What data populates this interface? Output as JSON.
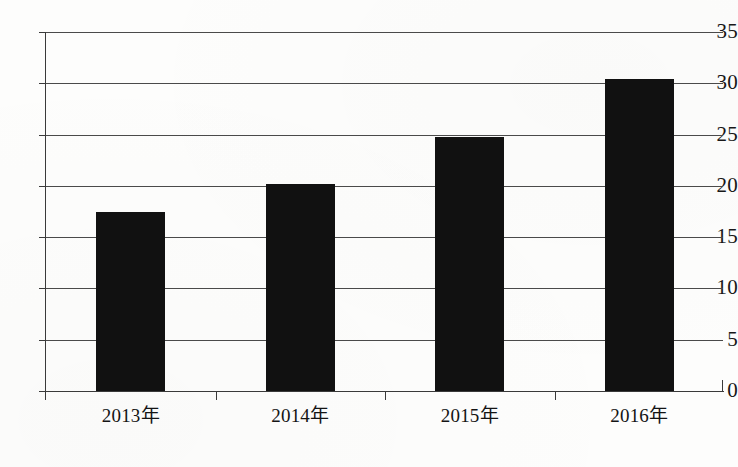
{
  "chart_data": {
    "type": "bar",
    "title": "",
    "subtitle": "",
    "xlabel": "",
    "ylabel": "",
    "categories": [
      "2013年",
      "2014年",
      "2015年",
      "2016年"
    ],
    "values": [
      17.5,
      20.2,
      24.8,
      30.4
    ],
    "series": [
      {
        "name": "",
        "values": [
          17.5,
          20.2,
          24.8,
          30.4
        ]
      }
    ],
    "ylim": [
      0,
      35
    ],
    "y_ticks": [
      0,
      5,
      10,
      15,
      20,
      25,
      30,
      35
    ],
    "y_tick_labels": [
      "0",
      "5",
      "10",
      "15",
      "20",
      "25",
      "30",
      "35"
    ],
    "grid": true,
    "grid_axis": "y",
    "legend": false,
    "legend_position": "none",
    "bar_color": "#111111",
    "axis_color": "#3a3a3a",
    "grid_color": "#4a4a4a",
    "background_color": "#fdfdfc",
    "annotations": []
  }
}
